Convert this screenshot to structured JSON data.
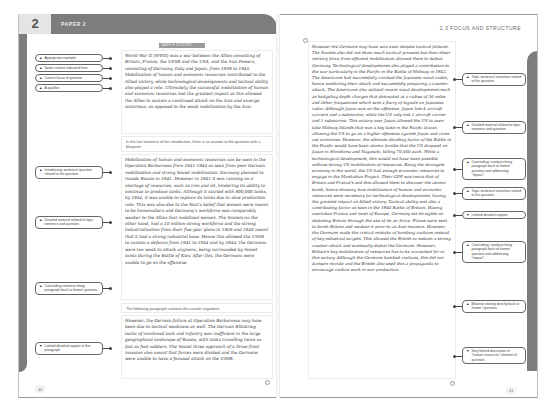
{
  "left_page": {
    "chapter_number": "2",
    "header_title": "PAPER 2",
    "label_strip": "SAMPLE STUDENT ANSWER",
    "page_number": "40",
    "intro_paragraph": "World War II (WWII) was a war between the Allies consisting of Britain, France, the USSR and the USA, and the Axis Powers, consisting of Germany, Italy and Japan, from 1939 to 1945. Mobilization of human and economic resources contributed to the Allied victory, while technological developments and tactical ability also played a role. Ultimately, the successful mobilization of human and economic resources had the greatest impact as this allowed the Allies to sustain a continued attack on the Axis and emerge victorious, as opposed to the weak mobilization by the Axis.",
    "note_1": "In the last sentence of the introduction, there is an answer to the question with a blueprint.",
    "body_paragraph": "Mobilization of human and economic resources can be seen in the Operation Barbarossa from 1941-1944 as seen from poor German mobilization and strong Soviet mobilization. Germany planned to invade Russia in 1941. However in 1941 it was running on a shortage of resources, such as iron and oil, hindering its ability to continue to produce tanks. Although it started with 800,000 tanks, by 1944, it was unable to replace its tanks due to slow production rate. This was also due to the Nazi's belief that women were meant to be homemakers and Germany's workforce was comparably weaker to the Allies that mobilized women. The Soviets on the other hand, had a 10 million strong workforce and the strong industrialization from their five-year plans in 1929 and 1940 meant that it had a strong industrial base. Hence this allowed the USSR to sustain a defence from 1941 to 1944 and by 1944, the Germans were too weak to attack anymore, being surrounded by Soviet tanks during the Battle of Kiev. After this, the Germans were unable to go on the offensive.",
    "note_2": "The following paragraph contains the counter argument.",
    "counter_paragraph": "However, the German failure at Operation Barbarossa may have been due to tactical weakness as well. The German Blitzkrieg tactic of combined tank and infantry was inefficient in the large geographical landscape of Russia, with tanks travelling twice as fast as foot soldiers. The Soviet three approach of a three-front invasion also meant that forces were divided and the Germans were unable to have a focused attack on the USSR.",
    "tags": [
      {
        "icon": "up-triangle",
        "text": "Appropriate example"
      },
      {
        "icon": "up-triangle",
        "text": "Some context indicated here"
      },
      {
        "icon": "up-triangle",
        "text": "Correct focus of question"
      },
      {
        "icon": "up-triangle",
        "text": "A qualifier"
      },
      {
        "icon": "up-triangle",
        "text": "Introductory sentence/ question related to the question."
      },
      {
        "icon": "up-triangle",
        "text": "Detailed material related to topic sentence and question."
      },
      {
        "icon": "up-triangle",
        "text": "Concluding sentence bring paragraph back to theme/ question."
      },
      {
        "icon": "down-triangle",
        "text": "Limited detailed support in this paragraph"
      }
    ]
  },
  "right_page": {
    "header_title": "2.3 FOCUS AND STRUCTURE",
    "page_number": "41",
    "paragraph": "However the Germans may have won even despite tactical failures. The Soviets also did not show much tactical prowess but their sheer military force from efficient mobilization allowed them to defeat Germany. Technological developments also played a contribution to the war particularly in the Pacific in the Battle of Midway in 1942. The Americans had successfully cracked the Japanese naval codes, hence predicting their attack and successfully preparing a counter attack. The Americans also utilized recent naval developments such as hedgehog depth charges that detonated at a radius of 30 miles and Other frequencies which sent a flurry of signals on Japanese radar. Although Japan was on the offensive, Japan lost 4 aircraft carriers and a submarine, while the US only lost 1 aircraft carrier and 1 submarine. This victory over Japan allowed the US to even take Midway Islands that was a key base in the Pacific Ocean, allowing the US to go on a higher offensive against Japan and come out victorious. However, the ultimate deciding factor of the Battle in the Pacific would have been atomic bombs that the US dropped on Japan in Hiroshima and Nagasaki, killing 70,000 each. While a technological development, this would not have been possible without strong US mobilization of resources. Being the strongest economy in the world, the US had enough economic resources to engage in the Manhattan Project. Their GDP was twice that of Britain and France's and this allowed them to discover the atomic bomb, hence showing how mobilization of human and economic resources were necessary for technological developments, having the greatest impact on Allied victory. Tactical ability was also a contributing factor as seen in the 1940 Battle of Britain. Having overtaken France and most of Europe, Germany set its sights on defeating Britain through the use of its air force. Planes were sent to bomb Britain and weaken it prior to an Axis invasion. However, the Germans made the critical mistake of bombing civilians instead of key industrial targets. This allowed the British to sustain a strong counter-attack and eventually defeat the Germans. However, Britain's key mobilization of resources has to be accounted for in this victory. Although the Germans bombed civilians, this did not dampen morale and the British also used this a propaganda to encourage civilian work in war production.",
    "tags": [
      {
        "icon": "up-triangle",
        "text": "Topic sentence/ assertion related to the question."
      },
      {
        "icon": "up-triangle",
        "text": "Detailed material related to topic sentence and question."
      },
      {
        "icon": "up-triangle",
        "text": "Concluding / analysis bring paragraph back to theme/ question and addressing \"impact\"."
      },
      {
        "icon": "up-triangle",
        "text": "Topic sentence/ assertion related to the question."
      },
      {
        "icon": "down-triangle",
        "text": "Limited detailed support."
      },
      {
        "icon": "up-triangle",
        "text": "Concluding / analysis bring paragraph back to theme/ question and addressing \"impact\"."
      },
      {
        "icon": "up-triangle",
        "text": "Material relating directly back to theme / question."
      },
      {
        "icon": "down-triangle",
        "text": "Very limited discussion of \"human resources\" element of question."
      }
    ]
  },
  "colors": {
    "band_gray": "#7d7d7d",
    "text_dark": "#333333",
    "tag_border": "#666666"
  }
}
